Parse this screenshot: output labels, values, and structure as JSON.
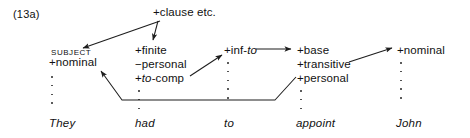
{
  "figure": {
    "example_number": "(13a)",
    "root_node": "+clause etc.",
    "columns": [
      {
        "word": "They",
        "function_label": "SUBJECT",
        "features": [
          "+nominal"
        ]
      },
      {
        "word": "had",
        "function_label": "",
        "features": [
          "+finite",
          "−personal",
          "+to-comp"
        ]
      },
      {
        "word": "to",
        "function_label": "",
        "features": [
          "+inf-to"
        ]
      },
      {
        "word": "appoint",
        "function_label": "",
        "features": [
          "+base",
          "+transitive",
          "+personal"
        ]
      },
      {
        "word": "John",
        "function_label": "",
        "features": [
          "+nominal"
        ]
      }
    ],
    "feature_parts": {
      "c2f3_plus": "+",
      "c2f3_italic": "to",
      "c2f3_tail": "-comp",
      "c3f1_plus": "+inf-",
      "c3f1_italic": "to"
    },
    "edges": [
      {
        "name": "clause-to-subject",
        "from": "+clause etc.",
        "to": "SUBJECT"
      },
      {
        "name": "clause-to-finite",
        "from": "+clause etc.",
        "to": "+finite"
      },
      {
        "name": "to-comp-to-inf-to",
        "from": "+to-comp",
        "to": "+inf-to"
      },
      {
        "name": "inf-to-to-base",
        "from": "+inf-to",
        "to": "+base"
      },
      {
        "name": "transitive-to-nominal",
        "from": "+transitive",
        "to": "+nominal"
      },
      {
        "name": "personal-to-nominal-subject",
        "from": "+personal",
        "to": "+nominal"
      }
    ],
    "colors": {
      "ink": "#111111",
      "line": "#3a3a3a",
      "background": "#ffffff"
    }
  }
}
